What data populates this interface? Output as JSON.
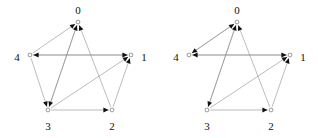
{
  "figure": {
    "type": "directed-graph-pair",
    "background_color": "#ffffff",
    "edge_color": "#8f8f8f",
    "arrow_color": "#101010",
    "vertex_fill": "#ffffff",
    "vertex_stroke": "#6e6e6e",
    "label_color": "#101010",
    "panel_count": 2
  },
  "graphs": [
    {
      "id": "left",
      "name": "directed-pentagon-left",
      "vertex_count": 5,
      "edge_count": 10,
      "vertices": [
        {
          "id": "0",
          "label": "0",
          "cx": 78,
          "cy": 22,
          "label_x": 78,
          "label_y": 11
        },
        {
          "id": "1",
          "label": "1",
          "cx": 131,
          "cy": 55,
          "label_x": 144,
          "label_y": 58
        },
        {
          "id": "2",
          "label": "2",
          "cx": 112,
          "cy": 110,
          "label_x": 112,
          "label_y": 127
        },
        {
          "id": "3",
          "label": "3",
          "cx": 48,
          "cy": 110,
          "label_x": 48,
          "label_y": 127
        },
        {
          "id": "4",
          "label": "4",
          "cx": 30,
          "cy": 55,
          "label_x": 17,
          "label_y": 58
        }
      ],
      "edges": [
        {
          "from": "4",
          "to": "0",
          "arrow": "to"
        },
        {
          "from": "3",
          "to": "0",
          "arrow": "to"
        },
        {
          "from": "2",
          "to": "0",
          "arrow": "to"
        },
        {
          "from": "4",
          "to": "1",
          "arrow": "to"
        },
        {
          "from": "3",
          "to": "1",
          "arrow": "to"
        },
        {
          "from": "2",
          "to": "1",
          "arrow": "to"
        },
        {
          "from": "1",
          "to": "4",
          "arrow": "to"
        },
        {
          "from": "3",
          "to": "2",
          "arrow": "to"
        },
        {
          "from": "0",
          "to": "3",
          "arrow": "to"
        },
        {
          "from": "4",
          "to": "3",
          "arrow": "to"
        }
      ]
    },
    {
      "id": "right",
      "name": "directed-pentagon-right",
      "vertex_count": 5,
      "edge_count": 10,
      "vertices": [
        {
          "id": "0",
          "label": "0",
          "cx": 78,
          "cy": 22,
          "label_x": 78,
          "label_y": 11
        },
        {
          "id": "1",
          "label": "1",
          "cx": 131,
          "cy": 55,
          "label_x": 144,
          "label_y": 58
        },
        {
          "id": "2",
          "label": "2",
          "cx": 112,
          "cy": 110,
          "label_x": 112,
          "label_y": 127
        },
        {
          "id": "3",
          "label": "3",
          "cx": 48,
          "cy": 110,
          "label_x": 48,
          "label_y": 127
        },
        {
          "id": "4",
          "label": "4",
          "cx": 30,
          "cy": 55,
          "label_x": 17,
          "label_y": 58
        }
      ],
      "edges": [
        {
          "from": "4",
          "to": "0",
          "arrow": "to"
        },
        {
          "from": "3",
          "to": "0",
          "arrow": "to"
        },
        {
          "from": "2",
          "to": "0",
          "arrow": "to"
        },
        {
          "from": "0",
          "to": "4",
          "arrow": "to"
        },
        {
          "from": "1",
          "to": "4",
          "arrow": "to"
        },
        {
          "from": "3",
          "to": "1",
          "arrow": "to"
        },
        {
          "from": "2",
          "to": "1",
          "arrow": "to"
        },
        {
          "from": "4",
          "to": "1",
          "arrow": "to"
        },
        {
          "from": "3",
          "to": "2",
          "arrow": "to"
        },
        {
          "from": "0",
          "to": "3",
          "arrow": "to"
        }
      ]
    }
  ]
}
